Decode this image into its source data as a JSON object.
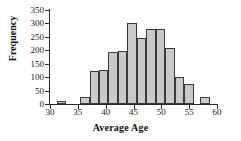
{
  "chart_data": {
    "type": "bar",
    "title": "",
    "subtitle": "",
    "xlabel": "Average Age",
    "ylabel": "Frequency",
    "xlim": [
      30,
      60
    ],
    "ylim": [
      0,
      350
    ],
    "grid": false,
    "legend": null,
    "annotations": [],
    "bin_width": 1.72,
    "x_ticks": [
      30,
      35,
      40,
      45,
      50,
      55,
      60
    ],
    "y_ticks": [
      0,
      50,
      100,
      150,
      200,
      250,
      300,
      350
    ],
    "bars": [
      {
        "x0": 31.2,
        "x1": 32.9,
        "value": 10
      },
      {
        "x0": 35.4,
        "x1": 37.1,
        "value": 25
      },
      {
        "x0": 37.1,
        "x1": 38.8,
        "value": 122
      },
      {
        "x0": 38.8,
        "x1": 40.5,
        "value": 128
      },
      {
        "x0": 40.5,
        "x1": 42.2,
        "value": 194
      },
      {
        "x0": 42.2,
        "x1": 43.9,
        "value": 196
      },
      {
        "x0": 43.9,
        "x1": 45.6,
        "value": 300
      },
      {
        "x0": 45.6,
        "x1": 47.3,
        "value": 245
      },
      {
        "x0": 47.3,
        "x1": 49.0,
        "value": 280
      },
      {
        "x0": 49.0,
        "x1": 50.7,
        "value": 281
      },
      {
        "x0": 50.7,
        "x1": 52.4,
        "value": 208
      },
      {
        "x0": 52.4,
        "x1": 54.1,
        "value": 100
      },
      {
        "x0": 54.1,
        "x1": 55.8,
        "value": 75
      },
      {
        "x0": 57.0,
        "x1": 58.7,
        "value": 27
      }
    ],
    "categories": [
      "31.2-32.9",
      "35.4-37.1",
      "37.1-38.8",
      "38.8-40.5",
      "40.5-42.2",
      "42.2-43.9",
      "43.9-45.6",
      "45.6-47.3",
      "47.3-49.0",
      "49.0-50.7",
      "50.7-52.4",
      "52.4-54.1",
      "54.1-55.8",
      "57.0-58.7"
    ],
    "values": [
      10,
      25,
      122,
      128,
      194,
      196,
      300,
      245,
      280,
      281,
      208,
      100,
      75,
      27
    ]
  },
  "colors": {
    "bar_fill": "#c9c9c9",
    "bar_border": "#3a3a3a",
    "axis": "#2b2b2b",
    "text": "#111111",
    "background": "#ffffff"
  }
}
